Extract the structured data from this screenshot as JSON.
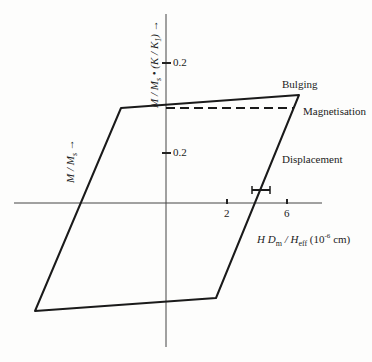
{
  "figure": {
    "y_axis_upper_label": "M / M",
    "y_axis_upper_sub": "s",
    "y_axis_upper_rest": " • (K / K",
    "y_axis_upper_sub2": "1",
    "y_axis_upper_end": ") →",
    "y_axis_lower_label": "M / M",
    "y_axis_lower_sub": "s",
    "y_axis_lower_arrow": "→",
    "x_axis_label_main": "H D",
    "x_axis_label_sub1": "m",
    "x_axis_label_mid": " / H",
    "x_axis_label_sub2": "eff",
    "x_axis_label_unit_pre": " (10",
    "x_axis_label_unit_sup": "-6",
    "x_axis_label_unit_post": " cm)",
    "tick_upper": "0.2",
    "tick_lower": "0.2",
    "tick_x1": "2",
    "tick_x2": "6",
    "annotations": {
      "bulging": "Bulging",
      "magnetisation": "Magnetisation",
      "displacement": "Displacement"
    }
  },
  "colors": {
    "line": "#1a1a1a",
    "axis": "#333333"
  }
}
